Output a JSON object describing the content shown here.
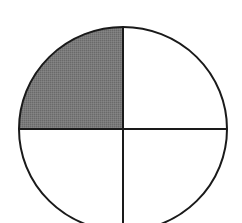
{
  "diagram": {
    "shape": "circle",
    "parts": 4,
    "shaded_parts": 1,
    "shaded_quadrant": "top-left",
    "fraction_shaded": "1/4",
    "colors": {
      "stroke": "#1a1a1a",
      "shade": "#777777",
      "background": "#ffffff"
    }
  }
}
